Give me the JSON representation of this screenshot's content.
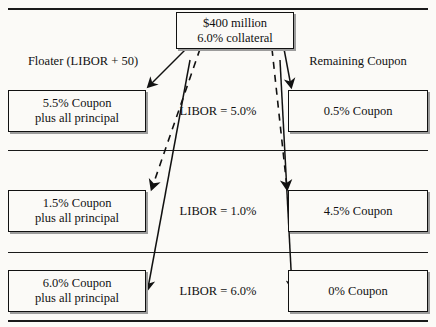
{
  "diagram": {
    "title_box": {
      "line1": "$400 million",
      "line2": "6.0% collateral"
    },
    "column_headers": {
      "left_line1": "Floater",
      "left_line2": "(LIBOR + 50)",
      "right": "Remaining Coupon"
    },
    "rows": [
      {
        "left_line1": "5.5% Coupon",
        "left_line2": "plus all principal",
        "center": "LIBOR = 5.0%",
        "right": "0.5% Coupon"
      },
      {
        "left_line1": "1.5% Coupon",
        "left_line2": "plus all principal",
        "center": "LIBOR = 1.0%",
        "right": "4.5% Coupon"
      },
      {
        "left_line1": "6.0% Coupon",
        "left_line2": "plus all principal",
        "center": "LIBOR = 6.0%",
        "right": "0% Coupon"
      }
    ],
    "colors": {
      "ink": "#111111",
      "background": "#fbfaf7",
      "shadow": "#9c9c9c"
    }
  }
}
